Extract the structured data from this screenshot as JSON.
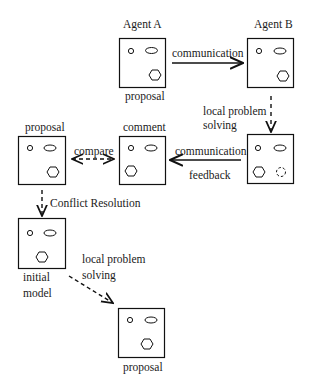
{
  "diagram": {
    "type": "flow",
    "nodes": [
      {
        "id": "agentA",
        "title": "Agent A",
        "caption": "proposal"
      },
      {
        "id": "agentB",
        "title": "Agent B",
        "caption": ""
      },
      {
        "id": "agentB2",
        "title": "",
        "caption": ""
      },
      {
        "id": "comment",
        "title": "comment",
        "caption": ""
      },
      {
        "id": "proposalLeft",
        "title": "proposal",
        "caption": ""
      },
      {
        "id": "initialModel",
        "title": "",
        "caption_line1": "initial",
        "caption_line2": "model"
      },
      {
        "id": "finalProposal",
        "title": "",
        "caption": "proposal"
      }
    ],
    "edges": [
      {
        "from": "agentA",
        "to": "agentB",
        "label": "communication",
        "style": "solid"
      },
      {
        "from": "agentB",
        "to": "agentB2",
        "label_line1": "local problem",
        "label_line2": "solving",
        "style": "dashed"
      },
      {
        "from": "agentB2",
        "to": "comment",
        "label_top": "communication",
        "label_bottom": "feedback",
        "style": "solid"
      },
      {
        "from": "comment",
        "to": "proposalLeft",
        "label": "compare",
        "style": "dashed-bidirectional"
      },
      {
        "from": "proposalLeft",
        "to": "initialModel",
        "label": "Conflict Resolution",
        "style": "dashed"
      },
      {
        "from": "initialModel",
        "to": "finalProposal",
        "label_line1": "local problem",
        "label_line2": "solving",
        "style": "dashed"
      }
    ],
    "shapes_legend": [
      "small circle",
      "ellipse",
      "hexagon",
      "dashed circle"
    ]
  }
}
